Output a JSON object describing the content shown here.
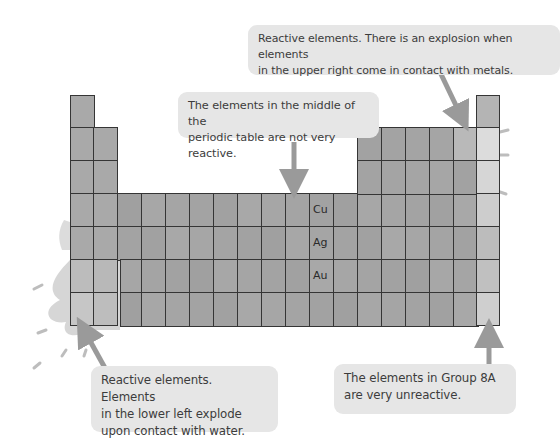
{
  "diagram": {
    "callouts": [
      {
        "id": "upper-right",
        "text_line1": "Reactive elements. There is an explosion when elements",
        "text_line2": "in the upper right come in contact with metals."
      },
      {
        "id": "middle",
        "text_line1": "The elements in the middle of the",
        "text_line2": "periodic table are not very reactive."
      },
      {
        "id": "lower-left",
        "text_line1": "Reactive elements. Elements",
        "text_line2": "in the lower left explode",
        "text_line3": "upon contact with water."
      },
      {
        "id": "group-8a",
        "text_line1": "The elements in Group 8A",
        "text_line2": "are very unreactive."
      }
    ],
    "element_labels": [
      "Cu",
      "Ag",
      "Au"
    ],
    "colors": {
      "cell_fill": "#a9a9a9",
      "cell_border": "#353535",
      "callout_bg": "#e6e6e6",
      "arrow": "#9a9a9a",
      "splash": "#d4d4d4",
      "text": "#3c3c3c"
    }
  }
}
